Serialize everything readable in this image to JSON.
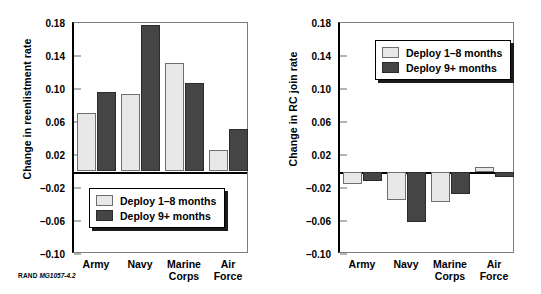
{
  "figure": {
    "credit_brand": "RAND",
    "credit_number": "MG1057-4.2"
  },
  "legend": {
    "series": [
      {
        "key": "light",
        "label": "Deploy 1–8 months",
        "color": "#e8e8e8"
      },
      {
        "key": "dark",
        "label": "Deploy 9+ months",
        "color": "#454545"
      }
    ]
  },
  "axis": {
    "ticks": [
      "0.18",
      "0.14",
      "0.10",
      "0.06",
      "0.02",
      "–0.02",
      "–0.06",
      "–0.10"
    ],
    "tick_values": [
      0.18,
      0.14,
      0.1,
      0.06,
      0.02,
      -0.02,
      -0.06,
      -0.1
    ],
    "min": -0.1,
    "max": 0.18
  },
  "categories": [
    "Army",
    "Navy",
    "Marine Corps",
    "Air Force"
  ],
  "category_lines": [
    [
      "Army"
    ],
    [
      "Navy"
    ],
    [
      "Marine",
      "Corps"
    ],
    [
      "Air",
      "Force"
    ]
  ],
  "chart_data": [
    {
      "type": "bar",
      "panel": "left",
      "title": "",
      "xlabel": "",
      "ylabel": "Change in reenlistment rate",
      "categories": [
        "Army",
        "Navy",
        "Marine Corps",
        "Air Force"
      ],
      "series": [
        {
          "name": "Deploy 1–8 months",
          "color": "#e8e8e8",
          "values": [
            0.071,
            0.094,
            0.132,
            0.026
          ]
        },
        {
          "name": "Deploy 9+ months",
          "color": "#454545",
          "values": [
            0.096,
            0.177,
            0.107,
            0.052
          ]
        }
      ],
      "ylim": [
        -0.1,
        0.18
      ],
      "yticks": [
        0.18,
        0.14,
        0.1,
        0.06,
        0.02,
        -0.02,
        -0.06,
        -0.1
      ],
      "grid": false,
      "legend_position": "inside-bottom-left"
    },
    {
      "type": "bar",
      "panel": "right",
      "title": "",
      "xlabel": "",
      "ylabel": "Change in RC join rate",
      "categories": [
        "Army",
        "Navy",
        "Marine Corps",
        "Air Force"
      ],
      "series": [
        {
          "name": "Deploy 1–8 months",
          "color": "#e8e8e8",
          "values": [
            -0.015,
            -0.035,
            -0.037,
            0.005
          ]
        },
        {
          "name": "Deploy 9+ months",
          "color": "#454545",
          "values": [
            -0.011,
            -0.061,
            -0.027,
            -0.007
          ]
        }
      ],
      "ylim": [
        -0.1,
        0.18
      ],
      "yticks": [
        0.18,
        0.14,
        0.1,
        0.06,
        0.02,
        -0.02,
        -0.06,
        -0.1
      ],
      "grid": false,
      "legend_position": "inside-top-right"
    }
  ]
}
